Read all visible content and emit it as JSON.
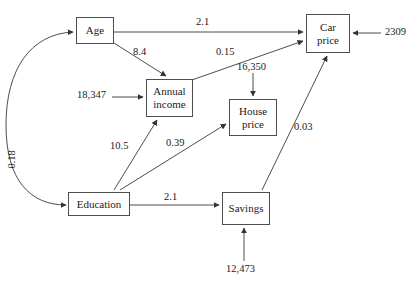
{
  "diagram": {
    "type": "path-diagram",
    "background_color": "#ffffff",
    "line_color": "#4d4d4d",
    "text_color": "#1a1a1a",
    "nodes": [
      {
        "id": "age",
        "label": "Age",
        "x": 76,
        "y": 17,
        "w": 38,
        "h": 27
      },
      {
        "id": "car_price",
        "label": "Car\nprice",
        "x": 306,
        "y": 14,
        "w": 44,
        "h": 39
      },
      {
        "id": "annual_income",
        "label": "Annual\nincome",
        "x": 146,
        "y": 79,
        "w": 47,
        "h": 38
      },
      {
        "id": "house_price",
        "label": "House\nprice",
        "x": 229,
        "y": 99,
        "w": 48,
        "h": 37
      },
      {
        "id": "education",
        "label": "Education",
        "x": 68,
        "y": 192,
        "w": 62,
        "h": 24
      },
      {
        "id": "savings",
        "label": "Savings",
        "x": 222,
        "y": 192,
        "w": 48,
        "h": 33
      }
    ],
    "edge_labels": [
      {
        "id": "age_to_car_price",
        "text": "2.1",
        "x": 196,
        "y": 17,
        "rotated": false
      },
      {
        "id": "age_to_annual_income",
        "text": "8.4",
        "x": 133,
        "y": 47,
        "rotated": false
      },
      {
        "id": "annual_income_to_car_price",
        "text": "0.15",
        "x": 216,
        "y": 47,
        "rotated": false
      },
      {
        "id": "house_price_error",
        "text": "16,350",
        "x": 237,
        "y": 62,
        "rotated": false
      },
      {
        "id": "car_price_error",
        "text": "2309",
        "x": 385,
        "y": 27,
        "rotated": false
      },
      {
        "id": "annual_income_error",
        "text": "18,347",
        "x": 77,
        "y": 90,
        "rotated": false
      },
      {
        "id": "education_to_annual_income",
        "text": "10.5",
        "x": 110,
        "y": 141,
        "rotated": false
      },
      {
        "id": "education_to_house_price",
        "text": "0.39",
        "x": 166,
        "y": 138,
        "rotated": false
      },
      {
        "id": "education_to_car_price",
        "text": "0.03",
        "x": 294,
        "y": 122,
        "rotated": false
      },
      {
        "id": "education_to_savings",
        "text": "2.1",
        "x": 164,
        "y": 192,
        "rotated": false
      },
      {
        "id": "savings_error",
        "text": "12,473",
        "x": 226,
        "y": 264,
        "rotated": false
      },
      {
        "id": "age_education_covariance",
        "text": "0.18",
        "x": 17,
        "y": 158,
        "rotated": true
      }
    ],
    "edges": [
      {
        "id": "age-to-car-price",
        "from": "age",
        "to": "car_price",
        "label": "2.1"
      },
      {
        "id": "age-to-annual-income",
        "from": "age",
        "to": "annual_income",
        "label": "8.4"
      },
      {
        "id": "annual-income-to-car-price",
        "from": "annual_income",
        "to": "car_price",
        "label": "0.15"
      },
      {
        "id": "education-to-annual-income",
        "from": "education",
        "to": "annual_income",
        "label": "10.5"
      },
      {
        "id": "education-to-house-price",
        "from": "education",
        "to": "house_price",
        "label": "0.39"
      },
      {
        "id": "education-to-car-price",
        "from": "education",
        "to": "car_price",
        "label": "0.03"
      },
      {
        "id": "education-to-savings",
        "from": "education",
        "to": "savings",
        "label": "2.1"
      },
      {
        "id": "error-to-car-price",
        "from": "error",
        "to": "car_price",
        "label": "2309"
      },
      {
        "id": "error-to-annual-income",
        "from": "error",
        "to": "annual_income",
        "label": "18,347"
      },
      {
        "id": "error-to-house-price",
        "from": "error",
        "to": "house_price",
        "label": "16,350"
      },
      {
        "id": "error-to-savings",
        "from": "error",
        "to": "savings",
        "label": "12,473"
      },
      {
        "id": "age-education-covariance",
        "from": "education",
        "to": "age",
        "label": "0.18"
      }
    ]
  }
}
